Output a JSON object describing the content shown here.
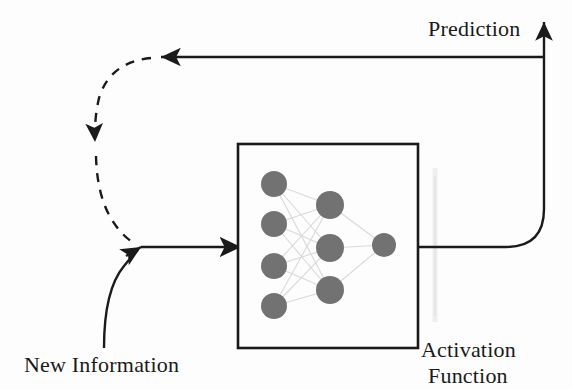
{
  "figure": {
    "background_color": "#fdfdfd",
    "line_color": "#1a1a1a",
    "node_color": "#727272",
    "connection_color": "#d8d8d8",
    "activation_bar_color": "#efefef"
  },
  "labels": {
    "prediction": "Prediction",
    "new_information": "New Information",
    "activation_function_line1": "Activation",
    "activation_function_line2": "Function"
  },
  "network": {
    "box": {
      "x": 238,
      "y": 144,
      "width": 180,
      "height": 204
    },
    "layers": [
      {
        "name": "input-layer",
        "node_radius": 13,
        "nodes": [
          {
            "cx": 274,
            "cy": 184
          },
          {
            "cx": 274,
            "cy": 224
          },
          {
            "cx": 274,
            "cy": 266
          },
          {
            "cx": 274,
            "cy": 306
          }
        ]
      },
      {
        "name": "hidden-layer",
        "node_radius": 14,
        "nodes": [
          {
            "cx": 330,
            "cy": 205
          },
          {
            "cx": 330,
            "cy": 248
          },
          {
            "cx": 330,
            "cy": 290
          }
        ]
      },
      {
        "name": "output-layer",
        "node_radius": 12,
        "nodes": [
          {
            "cx": 384,
            "cy": 245
          }
        ]
      }
    ],
    "activation_bar": {
      "x": 435,
      "y_top": 168,
      "y_bottom": 322,
      "width": 5
    }
  },
  "flows": [
    {
      "name": "new-information-inflow",
      "style": "solid",
      "description": "curve from bottom-left sweeping up to arrowhead then straight right into network box"
    },
    {
      "name": "prediction-outflow",
      "style": "solid",
      "description": "line exits network box right edge, curves up at right margin, arrow points up to Prediction"
    },
    {
      "name": "prediction-feedback",
      "style": "solid",
      "description": "horizontal line running leftwards from right margin with left arrowhead"
    },
    {
      "name": "feedback-dashed-loop",
      "style": "dashed",
      "description": "dashed curve from left arrowhead down the left side, downward arrowhead midway, rejoining the inflow arrow"
    }
  ]
}
